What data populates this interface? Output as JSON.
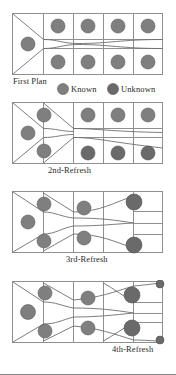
{
  "figure": {
    "title": "",
    "width": 176,
    "height": 375,
    "background": "#ffffff",
    "grid_stroke": "#8f8f8f",
    "flow_stroke": "#6e6e6e",
    "known_color": "#7f7f7f",
    "unknown_color": "#6a6a6a",
    "node_stroke": "#5a5a5a"
  },
  "legend": {
    "items": [
      {
        "label": "Known",
        "color": "#7f7f7f",
        "marker": "filled-circle"
      },
      {
        "label": "Unknown",
        "color": "#6a6a6a",
        "marker": "filled-circle"
      }
    ]
  },
  "panels": [
    {
      "id": "panel-first-plan",
      "caption": "First Plan",
      "columns": 5,
      "rows": 2,
      "nodes": [
        {
          "col": 0,
          "row": "mid",
          "type": "known"
        },
        {
          "col": 1,
          "row": "top",
          "type": "known"
        },
        {
          "col": 1,
          "row": "bottom",
          "type": "known"
        },
        {
          "col": 2,
          "row": "top",
          "type": "known"
        },
        {
          "col": 2,
          "row": "bottom",
          "type": "known"
        },
        {
          "col": 3,
          "row": "top",
          "type": "known"
        },
        {
          "col": 3,
          "row": "bottom",
          "type": "known"
        },
        {
          "col": 4,
          "row": "top",
          "type": "known"
        },
        {
          "col": 4,
          "row": "bottom",
          "type": "known"
        }
      ]
    },
    {
      "id": "panel-2nd-refresh",
      "caption": "2nd-Refresh",
      "columns": 5,
      "rows": 2,
      "nodes": [
        {
          "col": 0,
          "row": "mid",
          "type": "known"
        },
        {
          "col": 1,
          "row": "top",
          "type": "known"
        },
        {
          "col": 1,
          "row": "bottom",
          "type": "known"
        },
        {
          "col": 2,
          "row": "top",
          "type": "known"
        },
        {
          "col": 2,
          "row": "bottom",
          "type": "unknown"
        },
        {
          "col": 3,
          "row": "top",
          "type": "known"
        },
        {
          "col": 3,
          "row": "bottom",
          "type": "unknown"
        },
        {
          "col": 4,
          "row": "top",
          "type": "known"
        },
        {
          "col": 4,
          "row": "bottom",
          "type": "unknown"
        }
      ]
    },
    {
      "id": "panel-3rd-refresh",
      "caption": "3rd-Refresh",
      "columns": 5,
      "rows": 2,
      "nodes": [
        {
          "col": 0,
          "row": "mid",
          "type": "known"
        },
        {
          "col": 1,
          "row": "top",
          "type": "known"
        },
        {
          "col": 1,
          "row": "bottom",
          "type": "known"
        },
        {
          "col": 2,
          "row": "top",
          "type": "known"
        },
        {
          "col": 2,
          "row": "bottom",
          "type": "known"
        },
        {
          "col": 3,
          "row": "top",
          "type": "unknown"
        },
        {
          "col": 3,
          "row": "bottom",
          "type": "unknown"
        }
      ]
    },
    {
      "id": "panel-4th-refresh",
      "caption": "4th-Refresh",
      "columns": 5,
      "rows": 2,
      "nodes": [
        {
          "col": 0,
          "row": "mid",
          "type": "known"
        },
        {
          "col": 1,
          "row": "top",
          "type": "known"
        },
        {
          "col": 1,
          "row": "bottom",
          "type": "known"
        },
        {
          "col": 2,
          "row": "top",
          "type": "known"
        },
        {
          "col": 2,
          "row": "bottom",
          "type": "known"
        },
        {
          "col": 3,
          "row": "top",
          "type": "known"
        },
        {
          "col": 3,
          "row": "bottom",
          "type": "known"
        },
        {
          "col": 4,
          "row": "corner-top",
          "type": "unknown"
        },
        {
          "col": 4,
          "row": "corner-bottom",
          "type": "unknown"
        }
      ]
    }
  ]
}
